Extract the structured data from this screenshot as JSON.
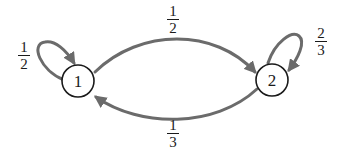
{
  "diagram": {
    "type": "markov-chain-state-diagram",
    "colors": {
      "edge": "#6b6b6b",
      "node_stroke": "#1a1a1a",
      "text": "#1a1a1a",
      "background": "#ffffff"
    },
    "nodes": [
      {
        "id": "1",
        "label": "1"
      },
      {
        "id": "2",
        "label": "2"
      }
    ],
    "edges": [
      {
        "from": "1",
        "to": "1",
        "prob": {
          "num": "1",
          "den": "2"
        }
      },
      {
        "from": "1",
        "to": "2",
        "prob": {
          "num": "1",
          "den": "2"
        }
      },
      {
        "from": "2",
        "to": "1",
        "prob": {
          "num": "1",
          "den": "3"
        }
      },
      {
        "from": "2",
        "to": "2",
        "prob": {
          "num": "2",
          "den": "3"
        }
      }
    ]
  }
}
